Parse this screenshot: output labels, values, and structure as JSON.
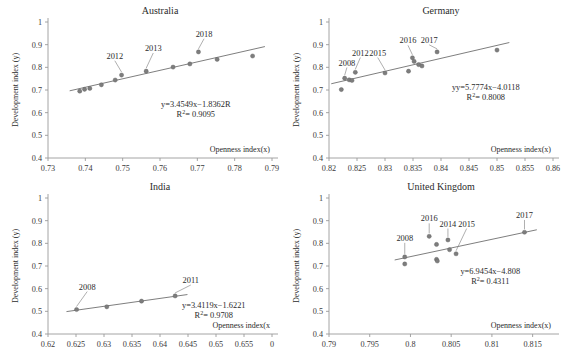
{
  "figure": {
    "axis_color": "#9a9a9a",
    "point_color": "#7d7d7d",
    "trend_color": "#6f6f6f",
    "background": "#ffffff"
  },
  "chart_data": [
    {
      "type": "scatter",
      "title": "Australia",
      "xlabel": "Openness index(x)",
      "ylabel": "Development index (y)",
      "xlim": [
        0.73,
        0.79
      ],
      "ylim": [
        0.4,
        1.0
      ],
      "xticks": [
        "0.73",
        "0.74",
        "0.75",
        "0.76",
        "0.77",
        "0.78",
        "0.79"
      ],
      "xtick_values": [
        0.73,
        0.74,
        0.75,
        0.76,
        0.77,
        0.78,
        0.79
      ],
      "yticks": [
        "0.4",
        "0.5",
        "0.6",
        "0.7",
        "0.8",
        "0.9",
        "1"
      ],
      "ytick_values": [
        0.4,
        0.5,
        0.6,
        0.7,
        0.8,
        0.9,
        1.0
      ],
      "grid": false,
      "legend": "none",
      "x": [
        0.7385,
        0.7398,
        0.7412,
        0.7443,
        0.748,
        0.7497,
        0.7563,
        0.7635,
        0.768,
        0.7703,
        0.7753,
        0.7848
      ],
      "y": [
        0.695,
        0.703,
        0.707,
        0.723,
        0.744,
        0.766,
        0.783,
        0.801,
        0.815,
        0.868,
        0.835,
        0.85
      ],
      "equation": "y=3.4549x−1.8362R",
      "r2_prefix": "R",
      "r2_sup": "2",
      "r2_value": "= 0.9095",
      "annotations": [
        {
          "label": "2012",
          "point_x": 0.7497,
          "point_y": 0.766,
          "text_x": 0.7479,
          "text_y": 0.838
        },
        {
          "label": "2013",
          "point_x": 0.7563,
          "point_y": 0.783,
          "text_x": 0.7582,
          "text_y": 0.872
        },
        {
          "label": "2018",
          "point_x": 0.7703,
          "point_y": 0.868,
          "text_x": 0.7718,
          "text_y": 0.935
        }
      ]
    },
    {
      "type": "scatter",
      "title": "Germany",
      "xlabel": "Openness index(x)",
      "ylabel": "Development index (y)",
      "xlim": [
        0.82,
        0.86
      ],
      "ylim": [
        0.4,
        1.0
      ],
      "xticks": [
        "0.82",
        "0.825",
        "0.83",
        "0.835",
        "0.84",
        "0.845",
        "0.85",
        "0.855",
        "0.86"
      ],
      "xtick_values": [
        0.82,
        0.825,
        0.83,
        0.835,
        0.84,
        0.845,
        0.85,
        0.855,
        0.86
      ],
      "yticks": [
        "0.4",
        "0.5",
        "0.6",
        "0.7",
        "0.8",
        "0.9",
        "1"
      ],
      "ytick_values": [
        0.4,
        0.5,
        0.6,
        0.7,
        0.8,
        0.9,
        1.0
      ],
      "grid": false,
      "legend": "none",
      "x": [
        0.8222,
        0.8228,
        0.8236,
        0.8241,
        0.8247,
        0.83,
        0.8342,
        0.8349,
        0.8352,
        0.836,
        0.8366,
        0.8393,
        0.85
      ],
      "y": [
        0.702,
        0.752,
        0.745,
        0.742,
        0.778,
        0.775,
        0.783,
        0.842,
        0.826,
        0.812,
        0.806,
        0.868,
        0.876
      ],
      "equation": "yy=5.7774x−4.0118",
      "r2_prefix": "R",
      "r2_sup": "2",
      "r2_value": "= 0.8008",
      "annotations": [
        {
          "label": "2008",
          "point_x": 0.8228,
          "point_y": 0.752,
          "text_x": 0.8232,
          "text_y": 0.808
        },
        {
          "label": "2012",
          "point_x": 0.8247,
          "point_y": 0.778,
          "text_x": 0.8256,
          "text_y": 0.852
        },
        {
          "label": "2015",
          "point_x": 0.83,
          "point_y": 0.775,
          "text_x": 0.8287,
          "text_y": 0.852
        },
        {
          "label": "2016",
          "point_x": 0.8349,
          "point_y": 0.842,
          "text_x": 0.8341,
          "text_y": 0.906
        },
        {
          "label": "2017",
          "point_x": 0.8393,
          "point_y": 0.868,
          "text_x": 0.8379,
          "text_y": 0.908
        }
      ]
    },
    {
      "type": "scatter",
      "title": "India",
      "xlabel": "Openness index(x",
      "ylabel": "Development index (y)",
      "xlim": [
        0.62,
        0.66
      ],
      "ylim": [
        0.4,
        1.0
      ],
      "xticks": [
        "0.62",
        "0.625",
        "0.63",
        "0.635",
        "0.64",
        "0.645",
        "0.65",
        "0.655",
        "0"
      ],
      "xtick_values": [
        0.62,
        0.625,
        0.63,
        0.635,
        0.64,
        0.645,
        0.65,
        0.655,
        0.66
      ],
      "yticks": [
        "0.4",
        "0.5",
        "0.6",
        "0.7",
        "0.8",
        "0.9",
        "1"
      ],
      "ytick_values": [
        0.4,
        0.5,
        0.6,
        0.7,
        0.8,
        0.9,
        1.0
      ],
      "grid": false,
      "legend": "none",
      "x": [
        0.6251,
        0.6305,
        0.6367,
        0.6427
      ],
      "y": [
        0.508,
        0.52,
        0.545,
        0.568
      ],
      "equation": "y=3.4119x−1.6221",
      "r2_prefix": "R",
      "r2_sup": "2",
      "r2_value": "= 0.9708",
      "annotations": [
        {
          "label": "2008",
          "point_x": 0.6251,
          "point_y": 0.508,
          "text_x": 0.627,
          "text_y": 0.596
        },
        {
          "label": "2011",
          "point_x": 0.6427,
          "point_y": 0.568,
          "text_x": 0.6455,
          "text_y": 0.625
        }
      ]
    },
    {
      "type": "scatter",
      "title": "United Kingdom",
      "xlabel": "Openness index(x)",
      "ylabel": "Development index (y)",
      "xlim": [
        0.79,
        0.8175
      ],
      "ylim": [
        0.4,
        1.0
      ],
      "xticks": [
        "0.79",
        "0.795",
        "0.8",
        "0.805",
        "0.81",
        "0.815"
      ],
      "xtick_values": [
        0.79,
        0.795,
        0.8,
        0.805,
        0.81,
        0.815
      ],
      "yticks": [
        "0.4",
        "0.5",
        "0.6",
        "0.7",
        "0.8",
        "0.9",
        "1"
      ],
      "ytick_values": [
        0.4,
        0.5,
        0.6,
        0.7,
        0.8,
        0.9,
        1.0
      ],
      "grid": false,
      "legend": "none",
      "x": [
        0.7993,
        0.7993,
        0.8023,
        0.8032,
        0.8032,
        0.8033,
        0.8046,
        0.8048,
        0.8056,
        0.814
      ],
      "y": [
        0.74,
        0.709,
        0.831,
        0.795,
        0.729,
        0.722,
        0.815,
        0.772,
        0.754,
        0.849
      ],
      "equation": "y=6.9454x−4.808",
      "r2_prefix": "R",
      "r2_sup": "2",
      "r2_value": "= 0.4311",
      "annotations": [
        {
          "label": "2008",
          "point_x": 0.7993,
          "point_y": 0.74,
          "text_x": 0.7993,
          "text_y": 0.811
        },
        {
          "label": "2016",
          "point_x": 0.8023,
          "point_y": 0.831,
          "text_x": 0.8023,
          "text_y": 0.897
        },
        {
          "label": "2014",
          "point_x": 0.8046,
          "point_y": 0.815,
          "text_x": 0.8046,
          "text_y": 0.874
        },
        {
          "label": "2015",
          "point_x": 0.8056,
          "point_y": 0.754,
          "text_x": 0.8069,
          "text_y": 0.874
        },
        {
          "label": "2017",
          "point_x": 0.814,
          "point_y": 0.849,
          "text_x": 0.814,
          "text_y": 0.912
        }
      ]
    }
  ]
}
